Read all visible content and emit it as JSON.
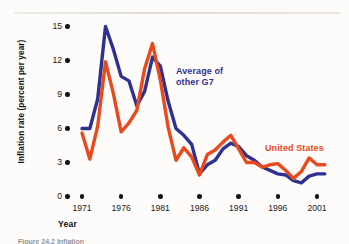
{
  "figure": {
    "caption_fragment": "Figure 24.2  Inflation",
    "axis_title_x": "Year",
    "axis_title_y": "Inflation rate (percent per year)"
  },
  "labels": {
    "g7": "Average of\nother G7",
    "g7_line1": "Average of",
    "g7_line2": "other G7",
    "us": "United States"
  },
  "colors": {
    "us_line": "#E8491D",
    "g7_line": "#2F3192",
    "axis_text": "#111111",
    "background": "#FDFCFA"
  },
  "chart_data": {
    "type": "line",
    "title": "",
    "xlabel": "Year",
    "ylabel": "Inflation rate (percent per year)",
    "xlim": [
      1971,
      2002
    ],
    "ylim": [
      0,
      16
    ],
    "yticks": [
      0,
      3,
      6,
      9,
      12,
      15
    ],
    "xticks": [
      1971,
      1976,
      1981,
      1986,
      1991,
      1996,
      2001
    ],
    "grid": false,
    "legend": "inline-annotation",
    "x": [
      1971,
      1972,
      1973,
      1974,
      1975,
      1976,
      1977,
      1978,
      1979,
      1980,
      1981,
      1982,
      1983,
      1984,
      1985,
      1986,
      1987,
      1988,
      1989,
      1990,
      1991,
      1992,
      1993,
      1994,
      1995,
      1996,
      1997,
      1998,
      1999,
      2000,
      2001,
      2002
    ],
    "series": [
      {
        "name": "Average of other G7",
        "color": "#2F3192",
        "values": [
          6.0,
          6.0,
          8.6,
          15.0,
          13.0,
          10.6,
          10.2,
          8.0,
          9.3,
          12.3,
          11.5,
          8.4,
          6.0,
          5.4,
          4.6,
          2.0,
          2.8,
          3.2,
          4.2,
          4.7,
          4.4,
          3.6,
          3.2,
          2.6,
          2.3,
          2.0,
          1.9,
          1.4,
          1.2,
          1.8,
          2.0,
          2.0
        ]
      },
      {
        "name": "United States",
        "color": "#E8491D",
        "values": [
          5.6,
          3.3,
          6.2,
          11.9,
          9.1,
          5.7,
          6.5,
          7.6,
          11.3,
          13.5,
          10.3,
          6.1,
          3.2,
          4.3,
          3.5,
          1.9,
          3.7,
          4.1,
          4.8,
          5.4,
          4.2,
          3.0,
          3.0,
          2.6,
          2.8,
          2.9,
          2.3,
          1.6,
          2.2,
          3.4,
          2.8,
          2.8
        ]
      }
    ]
  },
  "y_axis_ticks": [
    {
      "label": "15",
      "value": 15
    },
    {
      "label": "12",
      "value": 12
    },
    {
      "label": "9",
      "value": 9
    },
    {
      "label": "6",
      "value": 6
    },
    {
      "label": "3",
      "value": 3
    },
    {
      "label": "0",
      "value": 0
    }
  ],
  "x_axis_ticks": [
    {
      "label": "1971",
      "value": 1971
    },
    {
      "label": "1976",
      "value": 1976
    },
    {
      "label": "1981",
      "value": 1981
    },
    {
      "label": "1986",
      "value": 1986
    },
    {
      "label": "1991",
      "value": 1991
    },
    {
      "label": "1996",
      "value": 1996
    },
    {
      "label": "2001",
      "value": 2001
    }
  ]
}
